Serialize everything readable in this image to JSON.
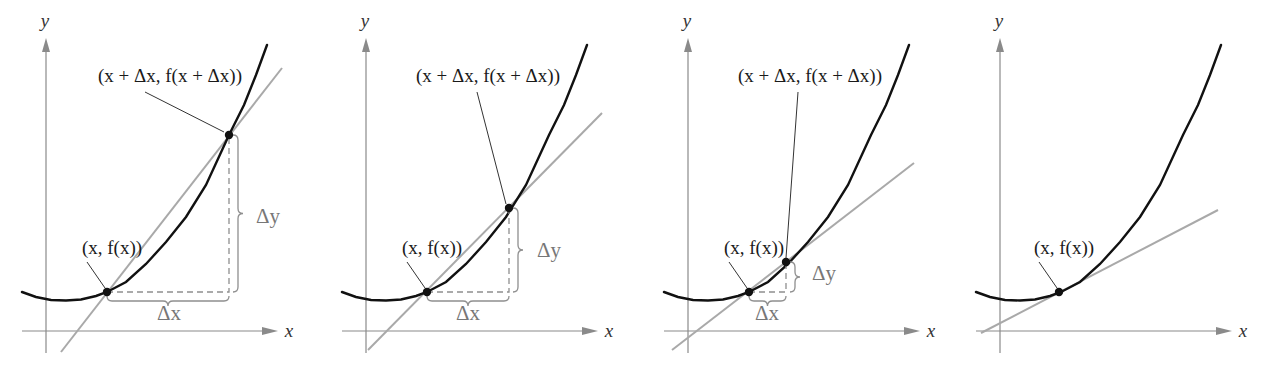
{
  "figure": {
    "colors": {
      "curve": "#111111",
      "secant": "#a9a9a9",
      "axis": "#8a8a8a",
      "guide": "#8f8f8f",
      "delta_label": "#777777"
    },
    "axis_labels": {
      "x": "x",
      "y": "y"
    },
    "labels": {
      "point": "(x, f(x))",
      "point_delta": "(x + Δx, f(x + Δx))",
      "delta_x": "Δx",
      "delta_y": "Δy"
    },
    "panels": [
      {
        "id": "panel-1",
        "origin": [
          46,
          331
        ],
        "point1": [
          107,
          292
        ],
        "point2": [
          229,
          135
        ],
        "secant": [
          [
            61,
            352
          ],
          [
            282,
            68
          ]
        ],
        "point_label_pos": [
          112,
          254
        ],
        "point_delta_label_pos": [
          170,
          82
        ],
        "leader2": [
          [
            145,
            92
          ],
          [
            224,
            132
          ]
        ],
        "delta_x_pos": [
          169,
          320
        ],
        "delta_y_pos": [
          256,
          223
        ]
      },
      {
        "id": "panel-2",
        "origin": [
          366,
          331
        ],
        "point1": [
          427,
          292
        ],
        "point2": [
          509,
          208
        ],
        "secant": [
          [
            368,
            350
          ],
          [
            602,
            113
          ]
        ],
        "point_label_pos": [
          432,
          254
        ],
        "point_delta_label_pos": [
          488,
          82
        ],
        "leader2": [
          [
            477,
            92
          ],
          [
            506,
            204
          ]
        ],
        "delta_x_pos": [
          468,
          320
        ],
        "delta_y_pos": [
          537,
          257
        ]
      },
      {
        "id": "panel-3",
        "origin": [
          688,
          331
        ],
        "point1": [
          749,
          292
        ],
        "point2": [
          786,
          262
        ],
        "secant": [
          [
            672,
            350
          ],
          [
            914,
            163
          ]
        ],
        "point_label_pos": [
          754,
          254
        ],
        "point_delta_label_pos": [
          810,
          82
        ],
        "leader2": [
          [
            798,
            92
          ],
          [
            786,
            258
          ]
        ],
        "delta_x_pos": [
          767,
          320
        ],
        "delta_y_pos": [
          812,
          280
        ]
      },
      {
        "id": "panel-4",
        "origin": [
          1000,
          331
        ],
        "point1": [
          1059,
          292
        ],
        "point2": null,
        "secant": [
          [
            981,
            333
          ],
          [
            1218,
            210
          ]
        ],
        "point_label_pos": [
          1064,
          254
        ],
        "point_delta_label_pos": null,
        "leader2": null,
        "delta_x_pos": null,
        "delta_y_pos": null
      }
    ]
  }
}
